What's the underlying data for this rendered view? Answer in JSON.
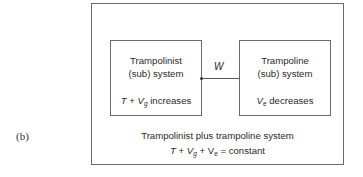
{
  "figure": {
    "label": "(b)",
    "connector_label": "W",
    "left_box": {
      "line1": "Trampolinist",
      "line2": "(sub) system",
      "eq_T": "T",
      "eq_plus": " + ",
      "eq_V": "V",
      "eq_sub": "g",
      "eq_rest": " increases"
    },
    "right_box": {
      "line1": "Trampoline",
      "line2": "(sub) system",
      "eq_V": "V",
      "eq_sub": "e",
      "eq_rest": " decreases"
    },
    "system": {
      "title": "Trampolinist plus trampoline system",
      "eq_T": "T",
      "eq_plus1": " + ",
      "eq_Vg": "V",
      "eq_g": "g",
      "eq_plus2": " + V",
      "eq_e": "e",
      "eq_rest": " = constant"
    },
    "colors": {
      "line": "#6a6a6a",
      "text": "#2a2a2a"
    }
  }
}
